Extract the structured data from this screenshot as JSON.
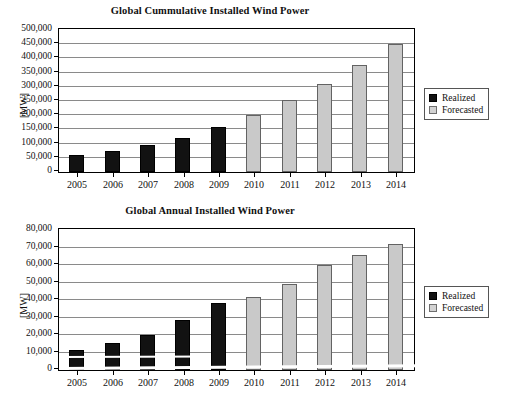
{
  "chart_data": [
    {
      "type": "bar",
      "title": "Global Cummulative Installed Wind Power",
      "xlabel": "",
      "ylabel": "[MW]",
      "categories": [
        "2005",
        "2006",
        "2007",
        "2008",
        "2009",
        "2010",
        "2011",
        "2012",
        "2013",
        "2014"
      ],
      "ylim": [
        0,
        500000
      ],
      "ytick_step": 50000,
      "yticks": [
        "0",
        "50,000",
        "100,000",
        "150,000",
        "200,000",
        "250,000",
        "300,000",
        "350,000",
        "400,000",
        "450,000",
        "500,000"
      ],
      "grid": true,
      "legend_position": "right",
      "series": [
        {
          "name": "Realized",
          "color": "#121212",
          "values": [
            59000,
            74000,
            94000,
            121000,
            159000,
            null,
            null,
            null,
            null,
            null
          ]
        },
        {
          "name": "Forecasted",
          "color": "#c9c9c9",
          "values": [
            null,
            null,
            null,
            null,
            null,
            201000,
            253000,
            311000,
            376000,
            449000
          ]
        }
      ]
    },
    {
      "type": "bar",
      "title": "Global Annual Installed Wind Power",
      "xlabel": "",
      "ylabel": "[MW]",
      "categories": [
        "2005",
        "2006",
        "2007",
        "2008",
        "2009",
        "2010",
        "2011",
        "2012",
        "2013",
        "2014"
      ],
      "ylim": [
        0,
        80000
      ],
      "ytick_step": 10000,
      "yticks": [
        "0",
        "10,000",
        "20,000",
        "30,000",
        "40,000",
        "50,000",
        "60,000",
        "70,000",
        "80,000"
      ],
      "grid": true,
      "legend_position": "right",
      "series": [
        {
          "name": "Realized",
          "color": "#121212",
          "values": [
            11500,
            15200,
            20000,
            28500,
            38300,
            null,
            null,
            null,
            null,
            null
          ]
        },
        {
          "name": "Forecasted",
          "color": "#c9c9c9",
          "values": [
            null,
            null,
            null,
            null,
            null,
            42000,
            49000,
            59800,
            65500,
            71800
          ]
        }
      ]
    }
  ],
  "top": {
    "title": "Global Cummulative Installed Wind Power",
    "ylabel": "[MW]",
    "legend": {
      "realized": "Realized",
      "forecasted": "Forecasted"
    }
  },
  "bottom": {
    "title": "Global Annual Installed Wind Power",
    "ylabel": "[MW]",
    "legend": {
      "realized": "Realized",
      "forecasted": "Forecasted"
    }
  }
}
